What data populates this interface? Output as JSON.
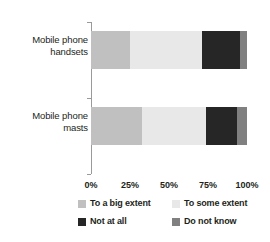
{
  "chart_data": {
    "type": "bar",
    "orientation": "horizontal",
    "stacked": true,
    "normalized_percent": true,
    "title": "",
    "subtitle": "",
    "xlabel": "",
    "ylabel": "",
    "categories": [
      "Mobile phone handsets",
      "Mobile phone masts"
    ],
    "category_lines": [
      [
        "Mobile phone",
        "handsets"
      ],
      [
        "Mobile phone",
        "masts"
      ]
    ],
    "series": [
      {
        "name": "To a big extent",
        "values": [
          25.0,
          33.0
        ],
        "color": "#c0c0c0"
      },
      {
        "name": "To some extent",
        "values": [
          46.0,
          41.0
        ],
        "color": "#e8e8e8"
      },
      {
        "name": "Not at all",
        "values": [
          24.5,
          19.5
        ],
        "color": "#262626"
      },
      {
        "name": "Do not know",
        "values": [
          4.5,
          6.5
        ],
        "color": "#808080"
      }
    ],
    "xlim": [
      0,
      100
    ],
    "xticks": [
      0,
      25,
      50,
      75,
      100
    ],
    "xtick_labels": [
      "0%",
      "25%",
      "50%",
      "75%",
      "100%"
    ],
    "grid": false,
    "legend_position": "bottom",
    "legend_columns": 2,
    "axis_color": "#9a9a9a",
    "text_color": "#231f20",
    "background": "#ffffff"
  },
  "legend": {
    "items": [
      {
        "label": "To a big extent"
      },
      {
        "label": "To some extent"
      },
      {
        "label": "Not at all"
      },
      {
        "label": "Do not know"
      }
    ]
  }
}
